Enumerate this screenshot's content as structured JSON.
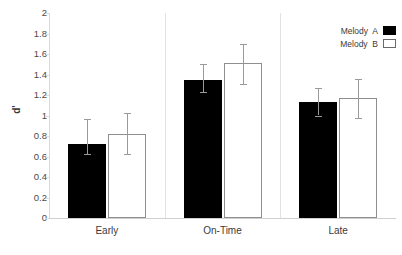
{
  "chart_data": {
    "type": "bar",
    "title": "",
    "xlabel": "",
    "ylabel": "d'",
    "ylim": [
      0,
      2
    ],
    "ytick_step": 0.2,
    "yticks": [
      "2",
      "1.8",
      "1.6",
      "1.4",
      "1.2",
      "1",
      "0.8",
      "0.6",
      "0.4",
      "0.2",
      "0"
    ],
    "categories": [
      "Early",
      "On-Time",
      "Late"
    ],
    "grid": false,
    "legend_position": "top-right",
    "legend": [
      "Melody  A",
      "Melody  B"
    ],
    "series": [
      {
        "name": "Melody  A",
        "color": "#000000",
        "fill": "solid",
        "values": [
          0.72,
          1.35,
          1.13
        ],
        "err_low": [
          0.62,
          1.23,
          1.0
        ],
        "err_high": [
          0.97,
          1.5,
          1.27
        ]
      },
      {
        "name": "Melody  B",
        "color": "#ffffff",
        "fill": "open",
        "values": [
          0.82,
          1.51,
          1.17
        ],
        "err_low": [
          0.62,
          1.31,
          0.98
        ],
        "err_high": [
          1.02,
          1.7,
          1.36
        ]
      }
    ]
  },
  "legend": {
    "rows": [
      {
        "label": "Melody  A",
        "style": "a"
      },
      {
        "label": "Melody  B",
        "style": "b"
      }
    ]
  }
}
